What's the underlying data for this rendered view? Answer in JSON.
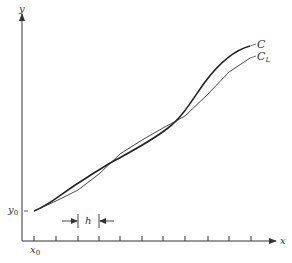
{
  "diagram": {
    "type": "function-approximation",
    "axes": {
      "x_label": "x",
      "y_label": "y"
    },
    "origin_labels": {
      "x0": "x",
      "x0_sub": "0",
      "y0": "y",
      "y0_sub": "0"
    },
    "step_label": "h",
    "curves": [
      {
        "id": "C",
        "label": "C",
        "label_sub": "",
        "style": "thick"
      },
      {
        "id": "CL",
        "label": "C",
        "label_sub": "L",
        "style": "thin-polyline"
      }
    ],
    "tick_count": 11,
    "colors": {
      "ink": "#333333",
      "background": "#ffffff"
    }
  }
}
